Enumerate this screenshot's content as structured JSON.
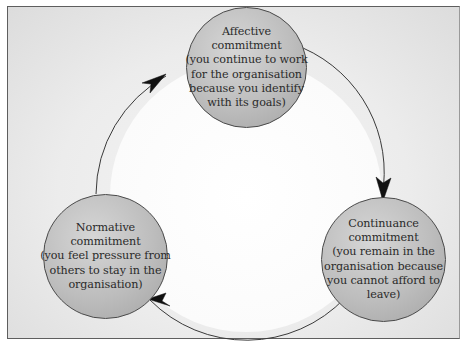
{
  "diagram": {
    "type": "cycle",
    "nodes": [
      {
        "id": "affective",
        "title": "Affective",
        "title2": "commitment",
        "desc": [
          "(you continue to work",
          "for the organisation",
          "because you identify",
          "with its goals)"
        ]
      },
      {
        "id": "continuance",
        "title": "Continuance",
        "title2": "commitment",
        "desc": [
          "(you remain in the",
          "organisation because",
          "you cannot afford to",
          "leave)"
        ]
      },
      {
        "id": "normative",
        "title": "Normative",
        "title2": "commitment",
        "desc": [
          "(you feel pressure from",
          "others to stay in the",
          "organisation)"
        ]
      }
    ],
    "edges": [
      {
        "from": "affective",
        "to": "continuance",
        "direction": "clockwise"
      },
      {
        "from": "continuance",
        "to": "normative",
        "direction": "clockwise"
      },
      {
        "from": "normative",
        "to": "affective",
        "direction": "clockwise"
      }
    ],
    "colors": {
      "node_fill": "#bdbdbd",
      "node_border": "#4a4a4a",
      "arrow": "#1a1a1a",
      "background": "#ececec",
      "cycle_interior": "#ffffff"
    }
  }
}
